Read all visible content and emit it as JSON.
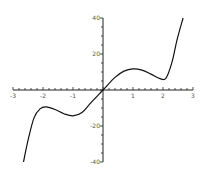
{
  "chart_data": {
    "type": "line",
    "title": "",
    "xlabel": "",
    "ylabel": "",
    "xlim": [
      -3,
      3
    ],
    "ylim": [
      -40,
      40
    ],
    "grid": false,
    "legend": null,
    "x_ticks": [
      -3,
      -2,
      -1,
      0,
      1,
      2,
      3
    ],
    "x_tick_labels": [
      "-3",
      "-2",
      "-1",
      "",
      "1",
      "2",
      "3"
    ],
    "x_minor_step": 0.2,
    "y_ticks": [
      -40,
      -20,
      20,
      40
    ],
    "y_tick_labels": [
      "-40",
      "-20",
      "20",
      "40"
    ],
    "y_minor_step": 5,
    "series": [
      {
        "name": "f(x)",
        "color": "#111111",
        "x": [
          -2.65,
          -2.5,
          -2.3,
          -2.1,
          -1.9,
          -1.6,
          -1.3,
          -1.0,
          -0.7,
          -0.4,
          0,
          0.4,
          0.7,
          1.0,
          1.3,
          1.6,
          1.9,
          2.1,
          2.3,
          2.47,
          2.67
        ],
        "y": [
          -40,
          -28,
          -15.5,
          -10.5,
          -9.4,
          -10.8,
          -13.2,
          -14.4,
          -12.5,
          -7,
          0,
          7,
          10.5,
          11.7,
          11,
          8.8,
          6.3,
          6.6,
          15.5,
          28,
          40
        ]
      }
    ]
  },
  "axes": {
    "origin_px": [
      103,
      90
    ],
    "x_px_per_unit": 30,
    "y_px_per_unit": 1.8,
    "axis_color": "#222222",
    "label_color": "#555555"
  }
}
